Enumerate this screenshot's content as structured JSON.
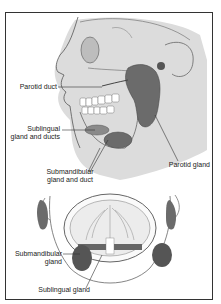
{
  "figure": {
    "views": [
      "lateral-head",
      "frontal-open-mouth"
    ]
  },
  "labels": {
    "parotid_duct": "Parotid duct",
    "sublingual_ducts_l1": "Sublingual",
    "sublingual_ducts_l2": "gland and ducts",
    "submandibular_duct_l1": "Submandibular",
    "submandibular_duct_l2": "gland and duct",
    "parotid_gland": "Parotid gland",
    "submandibular_gland_l1": "Submandibular",
    "submandibular_gland_l2": "gland",
    "sublingual_gland": "Sublingual gland"
  },
  "colors": {
    "border": "#333333",
    "skin_shade": "#d9d9d9",
    "gland": "#6b6b6b",
    "gland_dark": "#4a4a4a",
    "line": "#444444"
  }
}
